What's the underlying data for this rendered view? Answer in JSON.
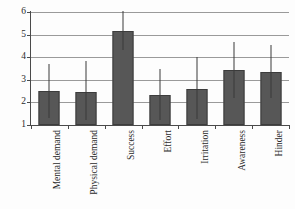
{
  "chart_data": {
    "type": "bar",
    "title": "",
    "xlabel": "",
    "ylabel": "",
    "ylim": [
      1,
      6
    ],
    "yticks": [
      1,
      2,
      3,
      4,
      5,
      6
    ],
    "grid": true,
    "legend": "none",
    "categories": [
      "Mental demand",
      "Physical demand",
      "Success",
      "Effort",
      "Irritation",
      "Awareness",
      "Hinder"
    ],
    "values": [
      2.5,
      2.45,
      5.15,
      2.33,
      2.6,
      3.43,
      3.35
    ],
    "error_upper": [
      3.68,
      3.85,
      6.05,
      3.48,
      4.0,
      4.67,
      4.55
    ],
    "error_lower": [
      1.33,
      1.2,
      4.3,
      1.22,
      1.27,
      2.2,
      2.18
    ],
    "series": [
      {
        "name": "Mean rating",
        "values": [
          2.5,
          2.45,
          5.15,
          2.33,
          2.6,
          3.43,
          3.35
        ]
      }
    ],
    "colors": {
      "bar_fill": "#575757",
      "bar_edge": "#3c3c3c",
      "gridline": "#9a9a9a",
      "axis": "#4a4a4a",
      "error_bar": "#3a3a3a",
      "background": "#fdfdfd",
      "text": "#2b2b2b"
    }
  }
}
